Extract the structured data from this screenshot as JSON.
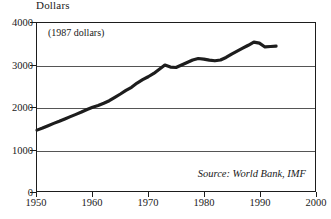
{
  "chart_data": {
    "type": "line",
    "title": "",
    "xlabel": "",
    "ylabel": "Dollars",
    "y_axis_title": "Dollars",
    "annotation_units": "(1987 dollars)",
    "annotation_source": "Source: World Bank, IMF",
    "xlim": [
      1950,
      2000
    ],
    "ylim": [
      0,
      4000
    ],
    "xticks": [
      1950,
      1960,
      1970,
      1980,
      1990,
      2000
    ],
    "xtick_labels": [
      "1950",
      "1960",
      "1970",
      "1980",
      "1990",
      "2000"
    ],
    "yticks": [
      0,
      1000,
      2000,
      3000,
      4000
    ],
    "ytick_labels": [
      "0",
      "1000",
      "2000",
      "3000",
      "4000"
    ],
    "grid": true,
    "gridlines_at": [
      1000,
      2000,
      3000
    ],
    "legend": false,
    "line_color": "#1d1d1d",
    "line_width": 3.2,
    "series": [
      {
        "name": "GDP per capita",
        "x": [
          1950,
          1951,
          1952,
          1953,
          1954,
          1955,
          1956,
          1957,
          1958,
          1959,
          1960,
          1961,
          1962,
          1963,
          1964,
          1965,
          1966,
          1967,
          1968,
          1969,
          1970,
          1971,
          1972,
          1973,
          1974,
          1975,
          1976,
          1977,
          1978,
          1979,
          1980,
          1981,
          1982,
          1983,
          1984,
          1985,
          1986,
          1987,
          1988,
          1989,
          1990,
          1991,
          1992,
          1993
        ],
        "values": [
          1450,
          1500,
          1555,
          1610,
          1660,
          1715,
          1770,
          1825,
          1880,
          1940,
          1995,
          2035,
          2090,
          2150,
          2230,
          2310,
          2395,
          2470,
          2570,
          2650,
          2720,
          2800,
          2900,
          3000,
          2950,
          2940,
          3000,
          3060,
          3120,
          3155,
          3140,
          3115,
          3100,
          3120,
          3180,
          3260,
          3330,
          3400,
          3470,
          3545,
          3520,
          3430,
          3440,
          3450
        ]
      }
    ]
  }
}
